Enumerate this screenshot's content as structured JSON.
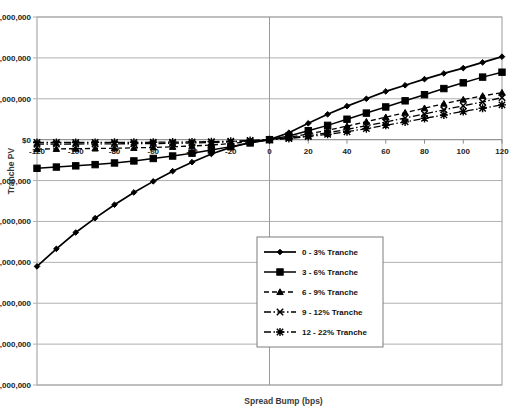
{
  "chart_data": {
    "type": "line",
    "title": "",
    "xlabel": "Spread Bump (bps)",
    "ylabel": "Tranche PV",
    "xlim": [
      -120,
      120
    ],
    "ylim": [
      -60000000,
      30000000
    ],
    "x": [
      -120,
      -110,
      -100,
      -90,
      -80,
      -70,
      -60,
      -50,
      -40,
      -30,
      -20,
      -10,
      0,
      10,
      20,
      30,
      40,
      50,
      60,
      70,
      80,
      90,
      100,
      110,
      120
    ],
    "xticks": [
      -120,
      -100,
      -80,
      -60,
      -40,
      -20,
      0,
      20,
      40,
      60,
      80,
      100,
      120
    ],
    "xtick_labels": [
      "-120",
      "-100",
      "-80",
      "-60",
      "-40",
      "-20",
      "0",
      "20",
      "40",
      "60",
      "80",
      "100",
      "120"
    ],
    "yticks": [
      30000000,
      20000000,
      10000000,
      0,
      -10000000,
      -20000000,
      -30000000,
      -40000000,
      -50000000,
      -60000000
    ],
    "ytick_labels": [
      "$30,000,000",
      "$20,000,000",
      "$10,000,000",
      "$0",
      "-$10,000,000",
      "-$20,000,000",
      "-$30,000,000",
      "-$40,000,000",
      "-$50,000,000",
      "-$60,000,000"
    ],
    "grid": true,
    "legend_position": "lower-center-right",
    "series": [
      {
        "name": "0 - 3% Tranche",
        "marker": "diamond",
        "linestyle": "solid",
        "color": "#000000",
        "values": [
          -31000000,
          -26700000,
          -22700000,
          -19200000,
          -15900000,
          -12900000,
          -10200000,
          -7700000,
          -5500000,
          -3500000,
          -1900000,
          -700000,
          0,
          1700000,
          4000000,
          6200000,
          8200000,
          10000000,
          11800000,
          13300000,
          14800000,
          16200000,
          17500000,
          18900000,
          20300000
        ]
      },
      {
        "name": "3 - 6% Tranche",
        "marker": "square",
        "linestyle": "solid",
        "color": "#000000",
        "values": [
          -7000000,
          -6700000,
          -6400000,
          -6100000,
          -5700000,
          -5200000,
          -4600000,
          -4000000,
          -3300000,
          -2500000,
          -1700000,
          -800000,
          0,
          900000,
          2200000,
          3500000,
          5000000,
          6500000,
          8000000,
          9500000,
          11000000,
          12500000,
          13900000,
          15300000,
          16500000
        ]
      },
      {
        "name": "6 - 9% Tranche",
        "marker": "triangle",
        "linestyle": "dashed",
        "color": "#000000",
        "values": [
          -2300000,
          -2250000,
          -2200000,
          -2150000,
          -2100000,
          -2000000,
          -1900000,
          -1750000,
          -1550000,
          -1300000,
          -950000,
          -500000,
          0,
          600000,
          1400000,
          2300000,
          3300000,
          4400000,
          5500000,
          6600000,
          7700000,
          8800000,
          9800000,
          10700000,
          11500000
        ]
      },
      {
        "name": "9 - 12% Tranche",
        "marker": "x",
        "linestyle": "dashdot",
        "color": "#000000",
        "values": [
          -1100000,
          -1080000,
          -1060000,
          -1040000,
          -1020000,
          -990000,
          -950000,
          -890000,
          -810000,
          -700000,
          -540000,
          -300000,
          0,
          400000,
          1000000,
          1700000,
          2500000,
          3400000,
          4300000,
          5300000,
          6300000,
          7300000,
          8300000,
          9200000,
          10300000
        ]
      },
      {
        "name": "12 - 22% Tranche",
        "marker": "star",
        "linestyle": "dashdot",
        "color": "#000000",
        "values": [
          -700000,
          -690000,
          -680000,
          -670000,
          -660000,
          -650000,
          -630000,
          -600000,
          -560000,
          -490000,
          -390000,
          -220000,
          0,
          300000,
          750000,
          1300000,
          1950000,
          2700000,
          3500000,
          4350000,
          5200000,
          6050000,
          6900000,
          7700000,
          8500000
        ]
      }
    ]
  },
  "legend": {
    "items": [
      {
        "label": "0 - 3% Tranche"
      },
      {
        "label": "3 - 6% Tranche"
      },
      {
        "label": "6 - 9% Tranche"
      },
      {
        "label": "9 - 12% Tranche"
      },
      {
        "label": "12 - 22% Tranche"
      }
    ]
  },
  "colors": {
    "plot_border": "#9a9a9a",
    "gridline": "#b0b0b0",
    "series": "#000000",
    "background": "#ffffff"
  }
}
